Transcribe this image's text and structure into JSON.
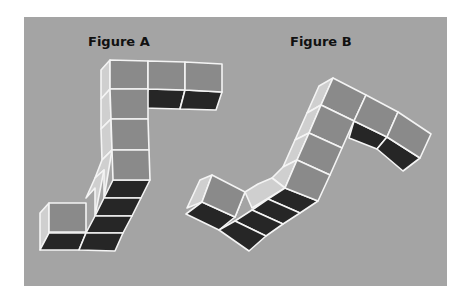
{
  "figure": {
    "title_a": "Figure A",
    "title_b": "Figure B"
  },
  "colors": {
    "panel": "#a4a4a4",
    "front_face": "#8a8a8a",
    "bottom_face": "#262626",
    "side_face": "#cfcfcf",
    "edge": "#f4f4f4"
  },
  "figure_a": {
    "label_pos": [
      88,
      46
    ],
    "cube_count": 10,
    "side": [
      [
        [
          110,
          60
        ],
        [
          101,
          70
        ],
        [
          101,
          99
        ],
        [
          110,
          89
        ]
      ],
      [
        [
          110,
          89
        ],
        [
          101,
          99
        ],
        [
          101,
          129
        ],
        [
          111,
          119
        ]
      ],
      [
        [
          111,
          119
        ],
        [
          101,
          129
        ],
        [
          102,
          160
        ],
        [
          112,
          150
        ]
      ],
      [
        [
          112,
          150
        ],
        [
          102,
          160
        ],
        [
          95,
          178
        ],
        [
          104,
          170
        ],
        [
          104,
          198
        ]
      ],
      [
        [
          104,
          170
        ],
        [
          95,
          178
        ],
        [
          86,
          198
        ],
        [
          95,
          188
        ],
        [
          95,
          216
        ]
      ],
      [
        [
          49,
          203
        ],
        [
          40,
          213
        ],
        [
          40,
          250
        ],
        [
          49,
          233
        ]
      ]
    ],
    "front": [
      [
        [
          110,
          60
        ],
        [
          148,
          61
        ],
        [
          148,
          89
        ],
        [
          110,
          89
        ]
      ],
      [
        [
          148,
          61
        ],
        [
          185,
          62
        ],
        [
          185,
          90
        ],
        [
          148,
          89
        ]
      ],
      [
        [
          185,
          62
        ],
        [
          222,
          64
        ],
        [
          222,
          92
        ],
        [
          185,
          90
        ]
      ],
      [
        [
          110,
          89
        ],
        [
          148,
          89
        ],
        [
          148,
          119
        ],
        [
          111,
          119
        ]
      ],
      [
        [
          111,
          119
        ],
        [
          148,
          119
        ],
        [
          149,
          150
        ],
        [
          112,
          150
        ]
      ],
      [
        [
          112,
          150
        ],
        [
          149,
          150
        ],
        [
          150,
          180
        ],
        [
          113,
          180
        ]
      ],
      [
        [
          49,
          203
        ],
        [
          86,
          203
        ],
        [
          86,
          232
        ],
        [
          49,
          232
        ]
      ]
    ],
    "bottom": [
      [
        [
          148,
          89
        ],
        [
          185,
          90
        ],
        [
          180,
          109
        ],
        [
          143,
          108
        ]
      ],
      [
        [
          185,
          90
        ],
        [
          222,
          92
        ],
        [
          216,
          110
        ],
        [
          180,
          109
        ]
      ],
      [
        [
          113,
          180
        ],
        [
          150,
          180
        ],
        [
          141,
          198
        ],
        [
          104,
          198
        ]
      ],
      [
        [
          104,
          198
        ],
        [
          141,
          198
        ],
        [
          132,
          216
        ],
        [
          95,
          216
        ]
      ],
      [
        [
          95,
          216
        ],
        [
          132,
          216
        ],
        [
          123,
          233
        ],
        [
          86,
          233
        ]
      ],
      [
        [
          49,
          233
        ],
        [
          86,
          233
        ],
        [
          79,
          250
        ],
        [
          40,
          250
        ]
      ],
      [
        [
          86,
          233
        ],
        [
          123,
          233
        ],
        [
          115,
          251
        ],
        [
          79,
          250
        ]
      ]
    ]
  },
  "figure_b": {
    "label_pos": [
      290,
      46
    ],
    "cube_count": 10,
    "side": [
      [
        [
          333,
          78
        ],
        [
          319,
          86
        ],
        [
          307,
          113
        ],
        [
          321,
          105
        ]
      ],
      [
        [
          321,
          105
        ],
        [
          307,
          113
        ],
        [
          295,
          140
        ],
        [
          309,
          133
        ]
      ],
      [
        [
          309,
          133
        ],
        [
          295,
          140
        ],
        [
          283,
          167
        ],
        [
          297,
          160
        ]
      ],
      [
        [
          297,
          160
        ],
        [
          283,
          167
        ],
        [
          272,
          178
        ],
        [
          285,
          188
        ]
      ],
      [
        [
          285,
          188
        ],
        [
          272,
          178
        ],
        [
          258,
          184
        ],
        [
          245,
          192
        ],
        [
          252,
          208
        ]
      ],
      [
        [
          212,
          175
        ],
        [
          200,
          180
        ],
        [
          187,
          208
        ],
        [
          202,
          202
        ]
      ],
      [
        [
          245,
          192
        ],
        [
          233,
          197
        ],
        [
          222,
          223
        ],
        [
          235,
          217
        ]
      ]
    ],
    "front": [
      [
        [
          333,
          78
        ],
        [
          366,
          95
        ],
        [
          354,
          121
        ],
        [
          321,
          105
        ]
      ],
      [
        [
          366,
          95
        ],
        [
          398,
          112
        ],
        [
          387,
          137
        ],
        [
          354,
          121
        ]
      ],
      [
        [
          398,
          112
        ],
        [
          431,
          134
        ],
        [
          420,
          158
        ],
        [
          387,
          137
        ]
      ],
      [
        [
          321,
          105
        ],
        [
          354,
          121
        ],
        [
          342,
          148
        ],
        [
          309,
          133
        ]
      ],
      [
        [
          309,
          133
        ],
        [
          342,
          148
        ],
        [
          330,
          175
        ],
        [
          297,
          160
        ]
      ],
      [
        [
          297,
          160
        ],
        [
          330,
          175
        ],
        [
          318,
          201
        ],
        [
          285,
          188
        ]
      ],
      [
        [
          212,
          175
        ],
        [
          245,
          192
        ],
        [
          235,
          217
        ],
        [
          202,
          202
        ]
      ]
    ],
    "bottom": [
      [
        [
          354,
          121
        ],
        [
          387,
          137
        ],
        [
          377,
          149
        ],
        [
          349,
          138
        ]
      ],
      [
        [
          387,
          137
        ],
        [
          420,
          158
        ],
        [
          403,
          171
        ],
        [
          377,
          149
        ]
      ],
      [
        [
          285,
          188
        ],
        [
          318,
          201
        ],
        [
          300,
          213
        ],
        [
          268,
          199
        ]
      ],
      [
        [
          268,
          199
        ],
        [
          300,
          213
        ],
        [
          283,
          224
        ],
        [
          252,
          210
        ]
      ],
      [
        [
          252,
          210
        ],
        [
          283,
          224
        ],
        [
          266,
          236
        ],
        [
          235,
          221
        ]
      ],
      [
        [
          202,
          202
        ],
        [
          235,
          217
        ],
        [
          219,
          230
        ],
        [
          186,
          214
        ]
      ],
      [
        [
          235,
          221
        ],
        [
          266,
          236
        ],
        [
          249,
          251
        ],
        [
          219,
          230
        ]
      ]
    ]
  }
}
